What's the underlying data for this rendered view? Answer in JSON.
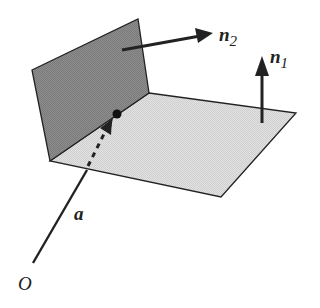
{
  "figure": {
    "kind": "two intersecting planes with normal vectors",
    "labels": {
      "normal_2": "n",
      "normal_2_sub": "2",
      "normal_1": "n",
      "normal_1_sub": "1",
      "vector": "a",
      "origin": "O"
    },
    "colors": {
      "vertical_plane": "#8c8c8c",
      "horizontal_plane": "#dcdcdc",
      "stroke": "#222222"
    }
  }
}
